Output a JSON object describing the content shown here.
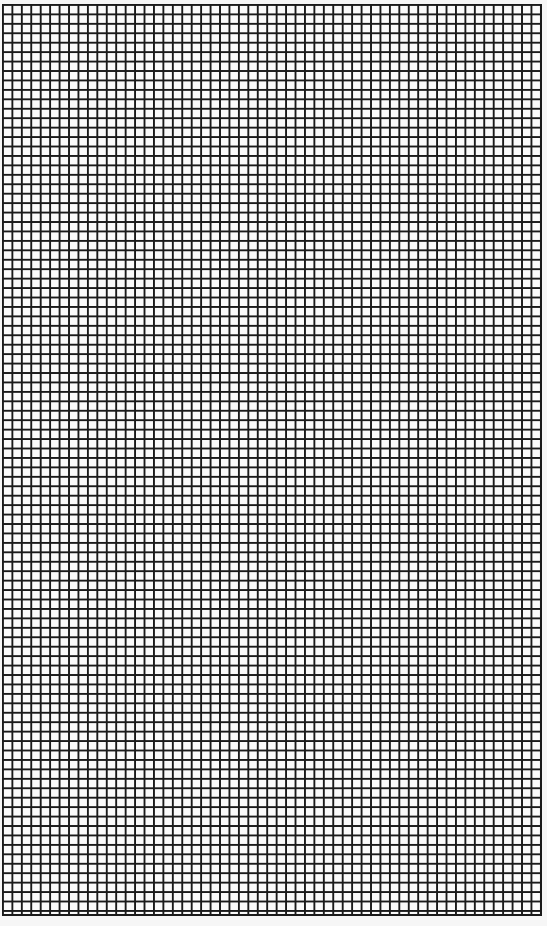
{
  "sheet": {
    "type": "graph-paper",
    "line_color": "#1a1a1a",
    "background_color": "#fafafa",
    "cell_size_px": 9.45,
    "columns": 57,
    "rows": 96
  }
}
